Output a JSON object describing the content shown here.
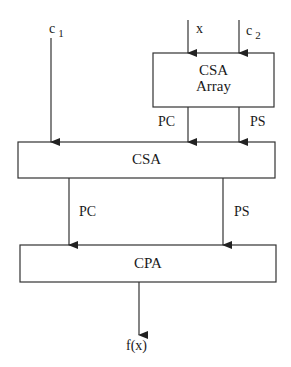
{
  "diagram": {
    "type": "block-diagram",
    "inputs": {
      "c1": {
        "base": "c",
        "subscript": "1"
      },
      "x": {
        "label": "x"
      },
      "c2": {
        "base": "c",
        "subscript": "2"
      }
    },
    "blocks": [
      {
        "id": "csa-array",
        "line1": "CSA",
        "line2": "Array"
      },
      {
        "id": "csa",
        "label": "CSA"
      },
      {
        "id": "cpa",
        "label": "CPA"
      }
    ],
    "edges": {
      "csa_array_to_csa": {
        "left": "PC",
        "right": "PS"
      },
      "csa_to_cpa": {
        "left": "PC",
        "right": "PS"
      }
    },
    "output": {
      "label": "f(x)"
    },
    "colors": {
      "stroke": "#333333",
      "background": "#ffffff"
    }
  }
}
